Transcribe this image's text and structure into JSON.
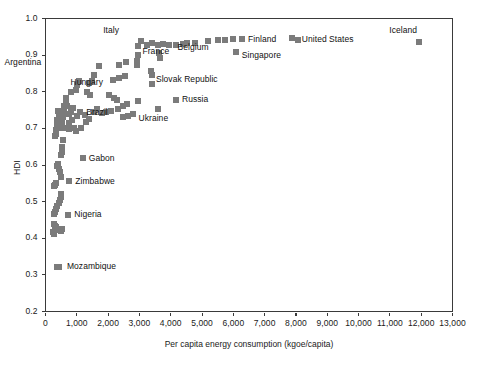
{
  "chart_data": {
    "type": "scatter",
    "title": "",
    "xlabel": "Per capita energy consumption (kgoe/capita)",
    "ylabel": "HDI",
    "xlim": [
      0,
      13000
    ],
    "ylim": [
      0.2,
      1.0
    ],
    "grid": false,
    "legend": "none",
    "marker": {
      "shape": "square",
      "color": "#7b7b7b",
      "size_px": 6
    },
    "xticks": [
      0,
      1000,
      2000,
      3000,
      4000,
      5000,
      6000,
      7000,
      8000,
      9000,
      10000,
      11000,
      12000,
      13000
    ],
    "xtick_labels": [
      "0",
      "1,000",
      "2,000",
      "3,000",
      "4,000",
      "5,000",
      "6,000",
      "7,000",
      "8,000",
      "9,000",
      "10,000",
      "11,000",
      "12,000",
      "13,000"
    ],
    "yticks": [
      0.2,
      0.3,
      0.4,
      0.5,
      0.6,
      0.7,
      0.8,
      0.9,
      1.0
    ],
    "ytick_labels": [
      "0.2",
      "0.3",
      "0.4",
      "0.5",
      "0.6",
      "0.7",
      "0.8",
      "0.9",
      "1.0"
    ],
    "annotations": [
      {
        "label": "Italy",
        "x": 3050,
        "y": 0.938,
        "dx": -22,
        "dy": -11
      },
      {
        "label": "Argentina",
        "x": 1720,
        "y": 0.869,
        "dx": -58,
        "dy": -4
      },
      {
        "label": "Hungary",
        "x": 2540,
        "y": 0.844,
        "dx": -22,
        "dy": 7
      },
      {
        "label": "France",
        "x": 4400,
        "y": 0.928,
        "dx": -14,
        "dy": 7
      },
      {
        "label": "Belgium",
        "x": 5720,
        "y": 0.941,
        "dx": -16,
        "dy": 7
      },
      {
        "label": "Finland",
        "x": 6280,
        "y": 0.943,
        "dx": 6,
        "dy": 0
      },
      {
        "label": "Singapore",
        "x": 6080,
        "y": 0.908,
        "dx": 6,
        "dy": 3
      },
      {
        "label": "United States",
        "x": 7900,
        "y": 0.944,
        "dx": 9,
        "dy": 0
      },
      {
        "label": "Iceland",
        "x": 11930,
        "y": 0.936,
        "dx": -2,
        "dy": -11
      },
      {
        "label": "Slovak Republic",
        "x": 3400,
        "y": 0.857,
        "dx": 4,
        "dy": 9
      },
      {
        "label": "Russia",
        "x": 4170,
        "y": 0.778,
        "dx": 6,
        "dy": 0
      },
      {
        "label": "Ukraine",
        "x": 2780,
        "y": 0.739,
        "dx": 6,
        "dy": 4
      },
      {
        "label": "Brazil",
        "x": 1110,
        "y": 0.744,
        "dx": 6,
        "dy": 0
      },
      {
        "label": "Gabon",
        "x": 1190,
        "y": 0.619,
        "dx": 6,
        "dy": 0
      },
      {
        "label": "Zimbabwe",
        "x": 760,
        "y": 0.555,
        "dx": 6,
        "dy": 0
      },
      {
        "label": "Nigeria",
        "x": 730,
        "y": 0.464,
        "dx": 6,
        "dy": 0
      },
      {
        "label": "Mozambique",
        "x": 430,
        "y": 0.322,
        "dx": 8,
        "dy": 0
      }
    ],
    "points": [
      {
        "x": 11930,
        "y": 0.936
      },
      {
        "x": 7880,
        "y": 0.946
      },
      {
        "x": 8080,
        "y": 0.94
      },
      {
        "x": 6280,
        "y": 0.943
      },
      {
        "x": 5980,
        "y": 0.944
      },
      {
        "x": 5720,
        "y": 0.941
      },
      {
        "x": 5500,
        "y": 0.94
      },
      {
        "x": 5180,
        "y": 0.938
      },
      {
        "x": 6080,
        "y": 0.908
      },
      {
        "x": 4760,
        "y": 0.934
      },
      {
        "x": 4520,
        "y": 0.934
      },
      {
        "x": 4380,
        "y": 0.93
      },
      {
        "x": 4180,
        "y": 0.929
      },
      {
        "x": 3950,
        "y": 0.928
      },
      {
        "x": 3760,
        "y": 0.93
      },
      {
        "x": 3600,
        "y": 0.927
      },
      {
        "x": 3400,
        "y": 0.932
      },
      {
        "x": 3230,
        "y": 0.929
      },
      {
        "x": 3050,
        "y": 0.938
      },
      {
        "x": 2960,
        "y": 0.925
      },
      {
        "x": 3640,
        "y": 0.905
      },
      {
        "x": 3660,
        "y": 0.893
      },
      {
        "x": 2960,
        "y": 0.9
      },
      {
        "x": 2930,
        "y": 0.884
      },
      {
        "x": 2930,
        "y": 0.872
      },
      {
        "x": 3380,
        "y": 0.858
      },
      {
        "x": 3400,
        "y": 0.846
      },
      {
        "x": 3400,
        "y": 0.822
      },
      {
        "x": 2560,
        "y": 0.88
      },
      {
        "x": 2340,
        "y": 0.872
      },
      {
        "x": 2540,
        "y": 0.844
      },
      {
        "x": 2350,
        "y": 0.838
      },
      {
        "x": 2150,
        "y": 0.832
      },
      {
        "x": 1720,
        "y": 0.869
      },
      {
        "x": 1560,
        "y": 0.846
      },
      {
        "x": 1500,
        "y": 0.828
      },
      {
        "x": 1390,
        "y": 0.824
      },
      {
        "x": 1060,
        "y": 0.828
      },
      {
        "x": 1010,
        "y": 0.818
      },
      {
        "x": 980,
        "y": 0.806
      },
      {
        "x": 820,
        "y": 0.8
      },
      {
        "x": 1340,
        "y": 0.798
      },
      {
        "x": 1420,
        "y": 0.79
      },
      {
        "x": 2020,
        "y": 0.79
      },
      {
        "x": 2180,
        "y": 0.782
      },
      {
        "x": 2280,
        "y": 0.777
      },
      {
        "x": 4170,
        "y": 0.778
      },
      {
        "x": 2960,
        "y": 0.774
      },
      {
        "x": 2600,
        "y": 0.766
      },
      {
        "x": 2460,
        "y": 0.76
      },
      {
        "x": 2300,
        "y": 0.752
      },
      {
        "x": 2100,
        "y": 0.748
      },
      {
        "x": 1940,
        "y": 0.745
      },
      {
        "x": 1800,
        "y": 0.742
      },
      {
        "x": 2780,
        "y": 0.739
      },
      {
        "x": 2620,
        "y": 0.734
      },
      {
        "x": 2460,
        "y": 0.73
      },
      {
        "x": 3580,
        "y": 0.752
      },
      {
        "x": 1110,
        "y": 0.744
      },
      {
        "x": 1250,
        "y": 0.737
      },
      {
        "x": 1010,
        "y": 0.734
      },
      {
        "x": 880,
        "y": 0.756
      },
      {
        "x": 820,
        "y": 0.746
      },
      {
        "x": 760,
        "y": 0.738
      },
      {
        "x": 700,
        "y": 0.76
      },
      {
        "x": 660,
        "y": 0.772
      },
      {
        "x": 640,
        "y": 0.782
      },
      {
        "x": 600,
        "y": 0.76
      },
      {
        "x": 580,
        "y": 0.745
      },
      {
        "x": 560,
        "y": 0.73
      },
      {
        "x": 540,
        "y": 0.722
      },
      {
        "x": 520,
        "y": 0.715
      },
      {
        "x": 500,
        "y": 0.706
      },
      {
        "x": 480,
        "y": 0.7
      },
      {
        "x": 460,
        "y": 0.712
      },
      {
        "x": 440,
        "y": 0.728
      },
      {
        "x": 420,
        "y": 0.74
      },
      {
        "x": 400,
        "y": 0.748
      },
      {
        "x": 380,
        "y": 0.722
      },
      {
        "x": 360,
        "y": 0.708
      },
      {
        "x": 340,
        "y": 0.695
      },
      {
        "x": 320,
        "y": 0.686
      },
      {
        "x": 300,
        "y": 0.68
      },
      {
        "x": 680,
        "y": 0.7
      },
      {
        "x": 740,
        "y": 0.698
      },
      {
        "x": 900,
        "y": 0.7
      },
      {
        "x": 1140,
        "y": 0.7
      },
      {
        "x": 1280,
        "y": 0.718
      },
      {
        "x": 1400,
        "y": 0.726
      },
      {
        "x": 1550,
        "y": 0.745
      },
      {
        "x": 1650,
        "y": 0.752
      },
      {
        "x": 760,
        "y": 0.716
      },
      {
        "x": 860,
        "y": 0.722
      },
      {
        "x": 980,
        "y": 0.694
      },
      {
        "x": 560,
        "y": 0.668
      },
      {
        "x": 520,
        "y": 0.65
      },
      {
        "x": 540,
        "y": 0.636
      },
      {
        "x": 480,
        "y": 0.628
      },
      {
        "x": 1190,
        "y": 0.619
      },
      {
        "x": 400,
        "y": 0.604
      },
      {
        "x": 380,
        "y": 0.596
      },
      {
        "x": 420,
        "y": 0.588
      },
      {
        "x": 460,
        "y": 0.58
      },
      {
        "x": 500,
        "y": 0.568
      },
      {
        "x": 760,
        "y": 0.555
      },
      {
        "x": 340,
        "y": 0.552
      },
      {
        "x": 300,
        "y": 0.546
      },
      {
        "x": 280,
        "y": 0.542
      },
      {
        "x": 480,
        "y": 0.522
      },
      {
        "x": 500,
        "y": 0.512
      },
      {
        "x": 460,
        "y": 0.504
      },
      {
        "x": 420,
        "y": 0.496
      },
      {
        "x": 380,
        "y": 0.487
      },
      {
        "x": 340,
        "y": 0.48
      },
      {
        "x": 300,
        "y": 0.472
      },
      {
        "x": 280,
        "y": 0.466
      },
      {
        "x": 730,
        "y": 0.464
      },
      {
        "x": 260,
        "y": 0.44
      },
      {
        "x": 300,
        "y": 0.434
      },
      {
        "x": 340,
        "y": 0.43
      },
      {
        "x": 380,
        "y": 0.426
      },
      {
        "x": 430,
        "y": 0.422
      },
      {
        "x": 480,
        "y": 0.42
      },
      {
        "x": 520,
        "y": 0.426
      },
      {
        "x": 240,
        "y": 0.416
      },
      {
        "x": 280,
        "y": 0.412
      },
      {
        "x": 430,
        "y": 0.322
      },
      {
        "x": 360,
        "y": 0.322
      }
    ]
  }
}
